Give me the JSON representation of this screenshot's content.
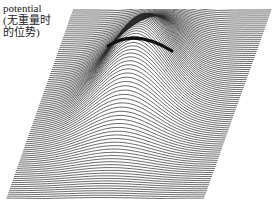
{
  "figure": {
    "label_lines": [
      "potential",
      "(无重量时",
      "的位势)"
    ],
    "colors": {
      "background": "#ffffff",
      "line": "#2a2a2a",
      "ridge": "#111111",
      "text": "#222222"
    },
    "surface": {
      "corners": {
        "top_left": [
          73,
          9
        ],
        "top_right": [
          272,
          9
        ],
        "bottom_right": [
          204,
          199
        ],
        "bottom_left": [
          6,
          199
        ]
      },
      "line_count": 95,
      "peak_center_x_ratio": 0.48,
      "peak_height_px": 70,
      "peak_width_ratio": 0.16
    }
  }
}
